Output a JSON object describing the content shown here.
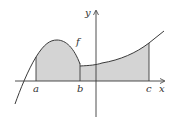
{
  "figure": {
    "type": "function-graph",
    "function_label": "f",
    "axis_labels": {
      "x": "x",
      "y": "y"
    },
    "points": {
      "a": "a",
      "b": "b",
      "c": "c"
    },
    "shaded_region": "area under f from a to c",
    "colors": {
      "shade": "#d4d4d4",
      "stroke": "#3a3a3a",
      "background": "#ffffff"
    }
  }
}
